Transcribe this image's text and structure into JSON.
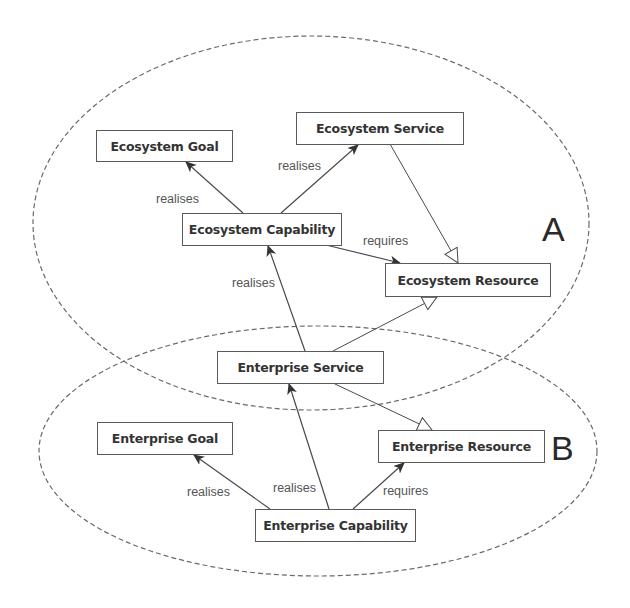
{
  "diagram": {
    "regions": [
      {
        "id": "A",
        "label": "A"
      },
      {
        "id": "B",
        "label": "B"
      }
    ],
    "nodes": {
      "ecosystem_goal": "Ecosystem Goal",
      "ecosystem_service": "Ecosystem Service",
      "ecosystem_capability": "Ecosystem Capability",
      "ecosystem_resource": "Ecosystem Resource",
      "enterprise_service": "Enterprise Service",
      "enterprise_goal": "Enterprise Goal",
      "enterprise_resource": "Enterprise Resource",
      "enterprise_capability": "Enterprise Capability"
    },
    "edges": [
      {
        "from": "Ecosystem Capability",
        "to": "Ecosystem Goal",
        "label": "realises",
        "type": "association"
      },
      {
        "from": "Ecosystem Capability",
        "to": "Ecosystem Service",
        "label": "realises",
        "type": "association"
      },
      {
        "from": "Ecosystem Capability",
        "to": "Ecosystem Resource",
        "label": "requires",
        "type": "association"
      },
      {
        "from": "Ecosystem Service",
        "to": "Ecosystem Resource",
        "label": "",
        "type": "generalization"
      },
      {
        "from": "Enterprise Service",
        "to": "Ecosystem Capability",
        "label": "realises",
        "type": "association"
      },
      {
        "from": "Enterprise Service",
        "to": "Ecosystem Resource",
        "label": "",
        "type": "generalization"
      },
      {
        "from": "Enterprise Service",
        "to": "Enterprise Resource",
        "label": "",
        "type": "generalization"
      },
      {
        "from": "Enterprise Capability",
        "to": "Enterprise Goal",
        "label": "realises",
        "type": "association"
      },
      {
        "from": "Enterprise Capability",
        "to": "Enterprise Service",
        "label": "realises",
        "type": "association"
      },
      {
        "from": "Enterprise Capability",
        "to": "Enterprise Resource",
        "label": "requires",
        "type": "association"
      }
    ],
    "edge_labels": {
      "eco_cap_goal": "realises",
      "eco_cap_service": "realises",
      "eco_cap_resource": "requires",
      "ent_service_eco_cap": "realises",
      "ent_cap_goal": "realises",
      "ent_cap_service": "realises",
      "ent_cap_resource": "requires"
    },
    "colors": {
      "line": "#4a4a4a",
      "dashed_boundary": "#6a6a6a",
      "box_border": "#5a5a5a",
      "text": "#333333"
    }
  }
}
